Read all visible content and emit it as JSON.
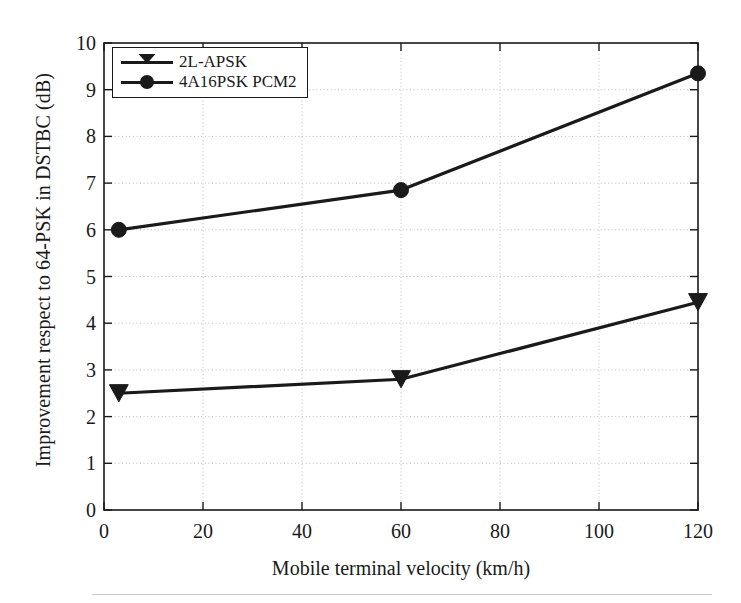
{
  "figure": {
    "background_color": "#ffffff",
    "foreground_color": "#1a1a1a",
    "grid_color": "#bfbfbf"
  },
  "axes": {
    "x_title": "Mobile terminal velocity (km/h)",
    "y_title": "Improvement respect to 64-PSK in DSTBC (dB)",
    "x_ticks": [
      "0",
      "20",
      "40",
      "60",
      "80",
      "100",
      "120"
    ],
    "y_ticks": [
      "0",
      "1",
      "2",
      "3",
      "4",
      "5",
      "6",
      "7",
      "8",
      "9",
      "10"
    ]
  },
  "legend": {
    "items": [
      {
        "label": "2L-APSK",
        "marker": "triangle-down-marker"
      },
      {
        "label": "4A16PSK PCM2",
        "marker": "circle-marker"
      }
    ]
  },
  "chart_data": {
    "type": "line",
    "title": "",
    "xlabel": "Mobile terminal velocity (km/h)",
    "ylabel": "Improvement respect to 64-PSK in DSTBC (dB)",
    "xlim": [
      0,
      120
    ],
    "ylim": [
      0,
      10
    ],
    "xticks": [
      0,
      20,
      40,
      60,
      80,
      100,
      120
    ],
    "yticks": [
      0,
      1,
      2,
      3,
      4,
      5,
      6,
      7,
      8,
      9,
      10
    ],
    "grid": true,
    "grid_style": "dotted",
    "legend_position": "upper left",
    "series": [
      {
        "name": "2L-APSK",
        "marker": "triangle-down",
        "color": "#1a1a1a",
        "x": [
          3,
          60,
          120
        ],
        "values": [
          2.5,
          2.8,
          4.45
        ]
      },
      {
        "name": "4A16PSK PCM2",
        "marker": "circle",
        "color": "#1a1a1a",
        "x": [
          3,
          60,
          120
        ],
        "values": [
          6.0,
          6.85,
          9.35
        ]
      }
    ]
  }
}
